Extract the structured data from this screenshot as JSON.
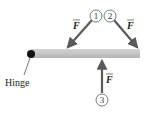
{
  "diagram": {
    "hinge_label": "Hinge",
    "force_symbol": "F",
    "forces": [
      {
        "id": "1",
        "label": "1",
        "direction": "down-left"
      },
      {
        "id": "2",
        "label": "2",
        "direction": "down-right"
      },
      {
        "id": "3",
        "label": "3",
        "direction": "up"
      }
    ],
    "colors": {
      "bar": "#c8c8c8",
      "arrow": "#666666",
      "hinge": "#111111"
    }
  }
}
